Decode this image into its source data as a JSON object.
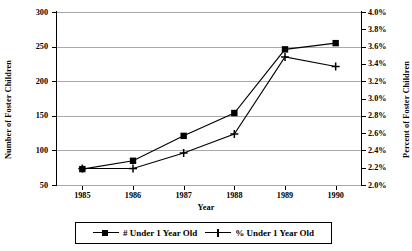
{
  "chart_data": {
    "type": "line",
    "title": "",
    "xlabel": "Year",
    "ylabel": "Number of Foster Children",
    "ylabel_right": "Percent of Foster Children",
    "categories": [
      "1985",
      "1986",
      "1987",
      "1988",
      "1989",
      "1990"
    ],
    "grid": true,
    "legend_position": "bottom",
    "axes": {
      "left": {
        "label": "Number of Foster Children",
        "ticks": [
          "50",
          "100",
          "150",
          "200",
          "250",
          "300"
        ],
        "ylim": [
          50,
          300
        ],
        "step": 50
      },
      "right": {
        "label": "Percent of Foster Children",
        "ticks": [
          "2.0%",
          "2.2%",
          "2.4%",
          "2.6%",
          "2.8%",
          "3.0%",
          "3.2%",
          "3.4%",
          "3.6%",
          "3.8%",
          "4.0%"
        ],
        "ylim": [
          2.0,
          4.0
        ],
        "step": 0.2
      }
    },
    "series": [
      {
        "name": "# Under 1 Year Old",
        "axis": "left",
        "marker": "square",
        "values": [
          73,
          85,
          121,
          154,
          246,
          255
        ]
      },
      {
        "name": "% Under 1 Year Old",
        "axis": "right",
        "marker": "plus",
        "values": [
          2.19,
          2.19,
          2.37,
          2.59,
          3.48,
          3.37
        ]
      }
    ]
  },
  "legend": {
    "entries": [
      {
        "label": "# Under 1 Year Old",
        "marker": "square"
      },
      {
        "label": "% Under 1 Year Old",
        "marker": "plus"
      }
    ]
  },
  "colors": {
    "series": "#000000",
    "grid": "#a9a9a9",
    "axis": "#000000",
    "background": "#ffffff"
  }
}
